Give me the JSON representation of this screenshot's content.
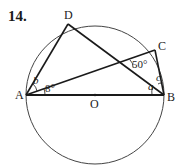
{
  "problem_number": "14.",
  "points": {
    "A": "A",
    "B": "B",
    "C": "C",
    "D": "D",
    "O": "O"
  },
  "angles": {
    "angle_CAB": "8°",
    "angle_intersection": "50°",
    "angle_a": "a",
    "angle_b": "b",
    "angle_c": "c"
  },
  "colors": {
    "stroke": "#1a1a1a",
    "circle": "#444444",
    "background": "#ffffff"
  }
}
